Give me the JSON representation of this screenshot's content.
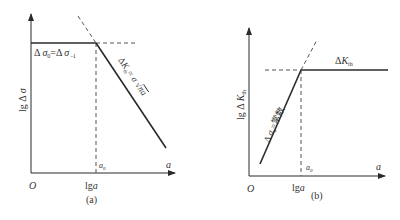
{
  "panel_a": {
    "caption": "(a)",
    "y_axis_label": "lgΔσ",
    "x_axis_label": "a",
    "origin_label": "O",
    "x_tick_label": "lga",
    "a0_label": "a₀",
    "plateau_label": "Δσ₀=Δσ₋₁",
    "slope_label": "ΔKₜₕ=σ√(πa)"
  },
  "panel_b": {
    "caption": "(b)",
    "y_axis_label": "lgΔKₜₕ",
    "x_axis_label": "a",
    "origin_label": "O",
    "x_tick_label": "lga",
    "a0_label": "a₀",
    "plateau_label": "ΔKₜₕ",
    "slope_label": "Δσ₀=常数"
  },
  "colors": {
    "line": "#2b2b2b",
    "dashed": "#555555",
    "text": "#333333"
  }
}
